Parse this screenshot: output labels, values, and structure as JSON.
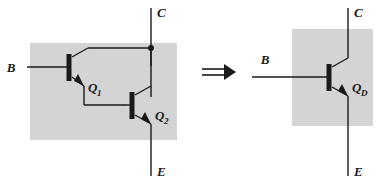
{
  "figure": {
    "type": "circuit-diagram",
    "background_color": "#ffffff",
    "shaded_box_color": "#d4d4d4",
    "line_color": "#1a1a1a"
  },
  "left_circuit": {
    "name": "darlington-pair",
    "terminals": {
      "base": "B",
      "collector": "C",
      "emitter": "E"
    },
    "transistors": [
      {
        "id": "q1",
        "label": "Q",
        "subscript": "1"
      },
      {
        "id": "q2",
        "label": "Q",
        "subscript": "2"
      }
    ]
  },
  "equivalence": {
    "symbol": "⟹",
    "name": "implies-arrow"
  },
  "right_circuit": {
    "name": "equivalent-transistor",
    "terminals": {
      "base": "B",
      "collector": "C",
      "emitter": "E"
    },
    "transistors": [
      {
        "id": "qd",
        "label": "Q",
        "subscript": "D"
      }
    ]
  }
}
